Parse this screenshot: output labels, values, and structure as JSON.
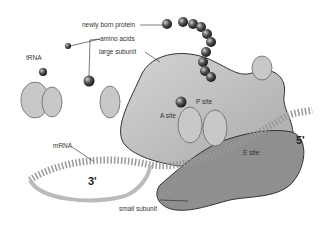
{
  "diagram": {
    "labels": {
      "newly_born_protein": "newly born protein",
      "amino_acids": "amino acids",
      "large_subunit": "large subunit",
      "trna": "tRNA",
      "p_site": "P site",
      "a_site": "A site",
      "e_site": "E site",
      "five_prime": "5'",
      "three_prime": "3'",
      "mrna": "mRNA",
      "small_subunit": "small subunit"
    },
    "colors": {
      "large_subunit": "#bdbdbd",
      "small_subunit": "#8f8f8f",
      "protein_bead": "#4a4a4a",
      "outline": "#333333",
      "leader": "#222222"
    }
  }
}
